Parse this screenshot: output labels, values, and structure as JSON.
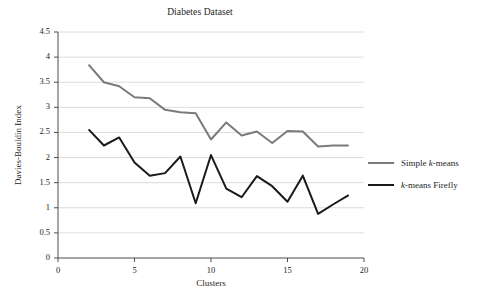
{
  "chart_data": {
    "type": "line",
    "title": "Diabetes Dataset",
    "xlabel": "Clusters",
    "ylabel": "Davies-Bouldin Index",
    "xlim": [
      0,
      20
    ],
    "ylim": [
      0,
      4.5
    ],
    "xticks": [
      "0",
      "5",
      "10",
      "15",
      "20"
    ],
    "xtick_values": [
      0,
      5,
      10,
      15,
      20
    ],
    "yticks": [
      "0",
      "0.5",
      "1",
      "1.5",
      "2",
      "2.5",
      "3",
      "3.5",
      "4",
      "4.5"
    ],
    "ytick_values": [
      0,
      0.5,
      1,
      1.5,
      2,
      2.5,
      3,
      3.5,
      4,
      4.5
    ],
    "grid": "horizontal",
    "legend_position": "right",
    "x": [
      2,
      3,
      4,
      5,
      6,
      7,
      8,
      9,
      10,
      11,
      12,
      13,
      14,
      15,
      16,
      17,
      18,
      19
    ],
    "series": [
      {
        "name": "Simple k-means",
        "name_parts": {
          "prefix": "Simple ",
          "italic": "k",
          "suffix": "-means"
        },
        "color": "#7a7a7a",
        "width": 2.0,
        "values": [
          3.85,
          3.5,
          3.42,
          3.2,
          3.18,
          2.95,
          2.9,
          2.88,
          2.36,
          2.7,
          2.44,
          2.52,
          2.29,
          2.53,
          2.52,
          2.22,
          2.24,
          2.24
        ]
      },
      {
        "name": "k-means Firefly",
        "name_parts": {
          "prefix": "",
          "italic": "k",
          "suffix": "-means Firefly"
        },
        "color": "#1a1a1a",
        "width": 2.0,
        "values": [
          2.56,
          2.24,
          2.4,
          1.9,
          1.64,
          1.69,
          2.02,
          1.09,
          2.05,
          1.38,
          1.21,
          1.63,
          1.43,
          1.12,
          1.64,
          0.88,
          1.07,
          1.25
        ]
      }
    ]
  }
}
